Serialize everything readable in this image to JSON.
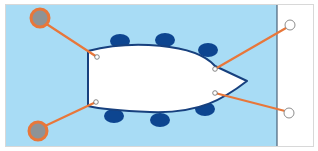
{
  "diagram": {
    "colors": {
      "water": "#a8dcf5",
      "dock": "#ffffff",
      "dock_border": "#d8d8d8",
      "dock_edge": "#4a6278",
      "hull_fill": "#ffffff",
      "hull_outline": "#17407e",
      "fender": "#0d4590",
      "line": "#e8773a",
      "bollard_fill": "#8e9396",
      "bollard_ring": "#e8773a",
      "dock_ring": "#ffffff",
      "dock_ring_stroke": "#8d8d8d",
      "cleat_fill": "#ffffff",
      "cleat_stroke": "#6a6a6a"
    },
    "water": {
      "x": 6,
      "y": 5,
      "width": 271,
      "height": 141
    },
    "dock": {
      "x": 277,
      "y": 5,
      "width": 36,
      "height": 141
    },
    "boat": {
      "path": "M88,51 C130,40 195,43 215,66 L247,81 C225,98 200,114 150,112 C125,111 100,109 88,106 Z"
    },
    "fenders": [
      {
        "name": "fender-port-1",
        "cx": 120,
        "cy": 41,
        "rx": 10,
        "ry": 7
      },
      {
        "name": "fender-port-2",
        "cx": 165,
        "cy": 40,
        "rx": 10,
        "ry": 7
      },
      {
        "name": "fender-port-3",
        "cx": 208,
        "cy": 50,
        "rx": 10,
        "ry": 7
      },
      {
        "name": "fender-starboard-1",
        "cx": 114,
        "cy": 116,
        "rx": 10,
        "ry": 7
      },
      {
        "name": "fender-starboard-2",
        "cx": 160,
        "cy": 120,
        "rx": 10,
        "ry": 7
      },
      {
        "name": "fender-starboard-3",
        "cx": 205,
        "cy": 109,
        "rx": 10,
        "ry": 7
      }
    ],
    "cleats": [
      {
        "name": "cleat-stern-port",
        "cx": 97,
        "cy": 57
      },
      {
        "name": "cleat-stern-starboard",
        "cx": 96,
        "cy": 102
      },
      {
        "name": "cleat-bow-port",
        "cx": 215,
        "cy": 69
      },
      {
        "name": "cleat-bow-starboard",
        "cx": 215,
        "cy": 93
      }
    ],
    "bollards": [
      {
        "name": "bollard-top-left",
        "cx": 40,
        "cy": 18
      },
      {
        "name": "bollard-bottom-left",
        "cx": 38,
        "cy": 131
      }
    ],
    "dock_rings": [
      {
        "name": "dock-ring-top",
        "cx": 290,
        "cy": 25
      },
      {
        "name": "dock-ring-bottom",
        "cx": 289,
        "cy": 113
      }
    ],
    "lines": [
      {
        "name": "stern-line-port",
        "x1": 45,
        "y1": 23,
        "x2": 97,
        "y2": 57
      },
      {
        "name": "stern-line-starboard",
        "x1": 45,
        "y1": 126,
        "x2": 96,
        "y2": 102
      },
      {
        "name": "bow-line-port",
        "x1": 215,
        "y1": 69,
        "x2": 286,
        "y2": 28
      },
      {
        "name": "bow-line-starboard",
        "x1": 215,
        "y1": 93,
        "x2": 285,
        "y2": 111
      }
    ]
  }
}
